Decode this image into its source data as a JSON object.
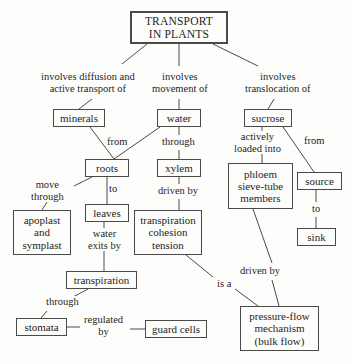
{
  "diagram": {
    "background_color": "#fdfdfc",
    "line_color": "#4a4a4a",
    "text_color": "#1d1d1d",
    "nodes": [
      {
        "id": "transport",
        "label": "TRANSPORT\nIN PLANTS",
        "x": 130,
        "y": 11,
        "w": 98,
        "h": 33
      },
      {
        "id": "minerals",
        "label": "minerals",
        "x": 53,
        "y": 109,
        "w": 52,
        "h": 18
      },
      {
        "id": "water",
        "label": "water",
        "x": 157,
        "y": 109,
        "w": 44,
        "h": 18
      },
      {
        "id": "sucrose",
        "label": "sucrose",
        "x": 244,
        "y": 109,
        "w": 48,
        "h": 18
      },
      {
        "id": "roots",
        "label": "roots",
        "x": 85,
        "y": 159,
        "w": 44,
        "h": 18
      },
      {
        "id": "xylem",
        "label": "xylem",
        "x": 157,
        "y": 159,
        "w": 44,
        "h": 18
      },
      {
        "id": "phloem",
        "label": "phloem\nsieve-tube\nmembers",
        "x": 228,
        "y": 163,
        "w": 65,
        "h": 46
      },
      {
        "id": "source",
        "label": "source",
        "x": 297,
        "y": 172,
        "w": 45,
        "h": 18
      },
      {
        "id": "leaves",
        "label": "leaves",
        "x": 85,
        "y": 204,
        "w": 44,
        "h": 18
      },
      {
        "id": "apoplast",
        "label": "apoplast\nand\nsymplast",
        "x": 13,
        "y": 210,
        "w": 58,
        "h": 45
      },
      {
        "id": "tct",
        "label": "transpiration\ncohesion\ntension",
        "x": 134,
        "y": 210,
        "w": 68,
        "h": 45
      },
      {
        "id": "sink",
        "label": "sink",
        "x": 297,
        "y": 228,
        "w": 39,
        "h": 18
      },
      {
        "id": "transpiration",
        "label": "transpiration",
        "x": 66,
        "y": 271,
        "w": 71,
        "h": 18
      },
      {
        "id": "stomata",
        "label": "stomata",
        "x": 16,
        "y": 318,
        "w": 51,
        "h": 18
      },
      {
        "id": "guardcells",
        "label": "guard cells",
        "x": 145,
        "y": 320,
        "w": 62,
        "h": 18
      },
      {
        "id": "pressureflow",
        "label": "pressure-flow\nmechanism\n(bulk flow)",
        "x": 240,
        "y": 306,
        "w": 79,
        "h": 45
      }
    ],
    "edge_labels": [
      {
        "id": "l-diffusion",
        "label": "involves diffusion and\nactive transport of",
        "cx": 88,
        "cy": 83
      },
      {
        "id": "l-movement",
        "label": "involves\nmovement of",
        "cx": 180,
        "cy": 83
      },
      {
        "id": "l-translocation",
        "label": "involves\ntranslocation of",
        "cx": 278,
        "cy": 83
      },
      {
        "id": "l-from",
        "label": "from",
        "cx": 117,
        "cy": 142
      },
      {
        "id": "l-through-x",
        "label": "through",
        "cx": 178,
        "cy": 142
      },
      {
        "id": "l-actively",
        "label": "actively\nloaded into",
        "cx": 257,
        "cy": 143
      },
      {
        "id": "l-from2",
        "label": "from",
        "cx": 314,
        "cy": 141
      },
      {
        "id": "l-move",
        "label": "move\nthrough",
        "cx": 47,
        "cy": 191
      },
      {
        "id": "l-to",
        "label": "to",
        "cx": 113,
        "cy": 189
      },
      {
        "id": "l-drivenby",
        "label": "driven by",
        "cx": 178,
        "cy": 191
      },
      {
        "id": "l-to2",
        "label": "to",
        "cx": 316,
        "cy": 209
      },
      {
        "id": "l-waterexits",
        "label": "water\nexits by",
        "cx": 104,
        "cy": 240
      },
      {
        "id": "l-drivenby2",
        "label": "driven by",
        "cx": 260,
        "cy": 271
      },
      {
        "id": "l-isa",
        "label": "is a",
        "cx": 224,
        "cy": 284
      },
      {
        "id": "l-through2",
        "label": "through",
        "cx": 62,
        "cy": 302
      },
      {
        "id": "l-regulated",
        "label": "regulated\nby",
        "cx": 104,
        "cy": 326
      }
    ],
    "edges": [
      {
        "id": "e-transport-minerals",
        "from": "transport",
        "to": "l-diffusion",
        "points": "147,44 122,64"
      },
      {
        "id": "e-diffusion-minerals",
        "from": "l-diffusion",
        "to": "minerals",
        "points": "92,99 79,109"
      },
      {
        "id": "e-transport-movement",
        "from": "transport",
        "to": "l-movement",
        "points": "179,44 179,66"
      },
      {
        "id": "e-movement-water",
        "from": "l-movement",
        "to": "water",
        "points": "179,99 179,109"
      },
      {
        "id": "e-transport-transloc",
        "from": "transport",
        "to": "l-translocation",
        "points": "213,44 258,66"
      },
      {
        "id": "e-transloc-sucrose",
        "from": "l-translocation",
        "to": "sucrose",
        "points": "274,99 268,109"
      },
      {
        "id": "e-minerals-roots",
        "from": "minerals",
        "to": "roots",
        "points": "90,127 114,159"
      },
      {
        "id": "e-water-roots",
        "from": "water",
        "to": "roots",
        "points": "160,127 114,159"
      },
      {
        "id": "e-water-xylem",
        "from": "water",
        "to": "xylem",
        "points": "179,127 179,135"
      },
      {
        "id": "e-through-xylem",
        "from": "l-through-x",
        "to": "xylem",
        "points": "179,150 179,159"
      },
      {
        "id": "e-roots-leaves",
        "from": "roots",
        "to": "leaves",
        "points": "107,177 107,204"
      },
      {
        "id": "e-roots-apoplast",
        "from": "roots",
        "to": "l-move",
        "points": "92,177 74,186"
      },
      {
        "id": "e-move-apoplast",
        "from": "l-move",
        "to": "apoplast",
        "points": "47,202 42,210"
      },
      {
        "id": "e-xylem-tct",
        "from": "xylem",
        "to": "l-drivenby",
        "points": "179,177 179,184"
      },
      {
        "id": "e-drivenby-tct",
        "from": "l-drivenby",
        "to": "tct",
        "points": "179,199 179,210"
      },
      {
        "id": "e-sucrose-phloem",
        "from": "sucrose",
        "to": "l-actively",
        "points": "262,127 262,133"
      },
      {
        "id": "e-actively-phloem",
        "from": "l-actively",
        "to": "phloem",
        "points": "262,154 262,163"
      },
      {
        "id": "e-sucrose-source",
        "from": "sucrose",
        "to": "source",
        "points": "283,127 314,172"
      },
      {
        "id": "e-source-sink",
        "from": "source",
        "to": "l-to2",
        "points": "316,190 316,202"
      },
      {
        "id": "e-to2-sink",
        "from": "l-to2",
        "to": "sink",
        "points": "316,217 316,228"
      },
      {
        "id": "e-leaves-transp",
        "from": "leaves",
        "to": "l-waterexits",
        "points": "104,222 104,230"
      },
      {
        "id": "e-waterexits-transp",
        "from": "l-waterexits",
        "to": "transpiration",
        "points": "104,251 104,271"
      },
      {
        "id": "e-transp-stomata",
        "from": "transpiration",
        "to": "l-through2",
        "points": "88,289 73,297"
      },
      {
        "id": "e-through2-stomata",
        "from": "l-through2",
        "to": "stomata",
        "points": "47,311 41,318"
      },
      {
        "id": "e-stomata-regulated",
        "from": "stomata",
        "to": "l-regulated",
        "points": "67,327 80,327"
      },
      {
        "id": "e-regulated-guard",
        "from": "l-regulated",
        "to": "guardcells",
        "points": "130,329 145,329"
      },
      {
        "id": "e-phloem-pressure",
        "from": "phloem",
        "to": "l-drivenby2",
        "points": "253,209 272,263"
      },
      {
        "id": "e-drivenby2-pressure",
        "from": "l-drivenby2",
        "to": "pressureflow",
        "points": "272,280 279,306"
      },
      {
        "id": "e-tct-isa",
        "from": "tct",
        "to": "l-isa",
        "points": "186,255 213,277"
      },
      {
        "id": "e-isa-pressure",
        "from": "l-isa",
        "to": "pressureflow",
        "points": "235,289 258,306"
      }
    ]
  }
}
